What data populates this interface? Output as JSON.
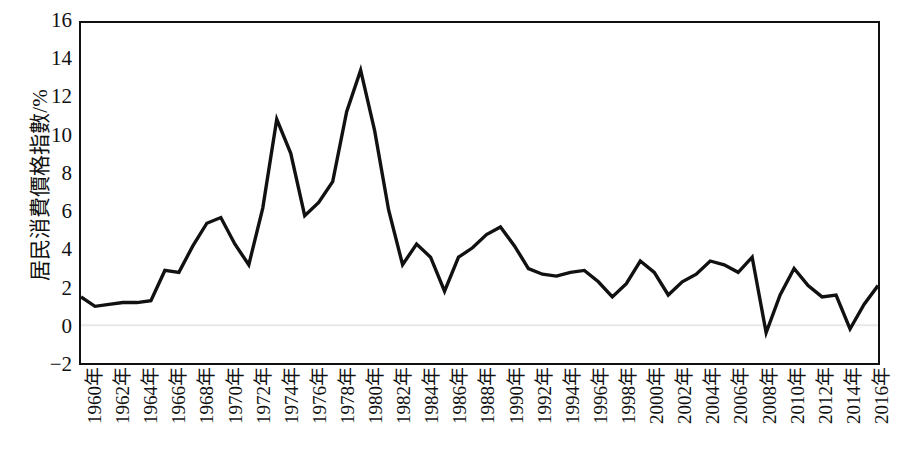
{
  "chart_data": {
    "type": "line",
    "title": "",
    "xlabel": "",
    "ylabel": "居民消費價格指數/%",
    "ylim": [
      -2,
      16
    ],
    "yticks": [
      -2,
      0,
      2,
      4,
      6,
      8,
      10,
      12,
      14,
      16
    ],
    "ytick_labels": [
      "−2",
      "0",
      "2",
      "4",
      "6",
      "8",
      "10",
      "12",
      "14",
      "16"
    ],
    "xlim": [
      1960,
      2017
    ],
    "xticks": [
      1960,
      1962,
      1964,
      1966,
      1968,
      1970,
      1972,
      1974,
      1976,
      1978,
      1980,
      1982,
      1984,
      1986,
      1988,
      1990,
      1992,
      1994,
      1996,
      1998,
      2000,
      2002,
      2004,
      2006,
      2008,
      2010,
      2012,
      2014,
      2016
    ],
    "xtick_labels": [
      "1960年",
      "1962年",
      "1964年",
      "1966年",
      "1968年",
      "1970年",
      "1972年",
      "1974年",
      "1976年",
      "1978年",
      "1980年",
      "1982年",
      "1984年",
      "1986年",
      "1988年",
      "1990年",
      "1992年",
      "1994年",
      "1996年",
      "1998年",
      "2000年",
      "2002年",
      "2004年",
      "2006年",
      "2008年",
      "2010年",
      "2012年",
      "2014年",
      "2016年"
    ],
    "grid": false,
    "legend": null,
    "line_color": "#111111",
    "zero_line_color": "#e8e8e8",
    "x": [
      1960,
      1961,
      1962,
      1963,
      1964,
      1965,
      1966,
      1967,
      1968,
      1969,
      1970,
      1971,
      1972,
      1973,
      1974,
      1975,
      1976,
      1977,
      1978,
      1979,
      1980,
      1981,
      1982,
      1983,
      1984,
      1985,
      1986,
      1987,
      1988,
      1989,
      1990,
      1991,
      1992,
      1993,
      1994,
      1995,
      1996,
      1997,
      1998,
      1999,
      2000,
      2001,
      2002,
      2003,
      2004,
      2005,
      2006,
      2007,
      2008,
      2009,
      2010,
      2011,
      2012,
      2013,
      2014,
      2015,
      2016,
      2017
    ],
    "y": [
      1.5,
      1.0,
      1.1,
      1.2,
      1.2,
      1.3,
      2.9,
      2.8,
      4.2,
      5.4,
      5.7,
      4.3,
      3.2,
      6.2,
      10.9,
      9.1,
      5.8,
      6.5,
      7.6,
      11.3,
      13.5,
      10.3,
      6.1,
      3.2,
      4.3,
      3.6,
      1.8,
      3.6,
      4.1,
      4.8,
      5.2,
      4.2,
      3.0,
      2.7,
      2.6,
      2.8,
      2.9,
      2.3,
      1.5,
      2.2,
      3.4,
      2.8,
      1.6,
      2.3,
      2.7,
      3.4,
      3.2,
      2.8,
      3.6,
      -0.4,
      1.6,
      3.0,
      2.1,
      1.5,
      1.6,
      -0.2,
      1.1,
      2.1
    ],
    "notable_points": [
      {
        "year": 1974,
        "value": 10.9,
        "label": "peak"
      },
      {
        "year": 1980,
        "value": 13.5,
        "label": "max"
      },
      {
        "year": 2009,
        "value": -0.4,
        "label": "min"
      },
      {
        "year": 2015,
        "value": -0.2,
        "label": "dip"
      }
    ]
  },
  "axes": {
    "y_title": "居民消費價格指數/%"
  }
}
